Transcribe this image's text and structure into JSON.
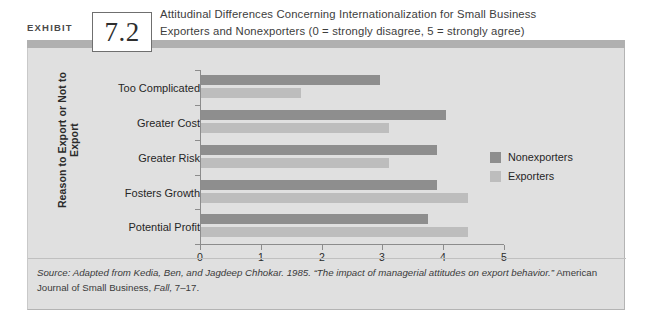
{
  "exhibit": {
    "label": "EXHIBIT",
    "number": "7.2"
  },
  "title": {
    "line1": "Attitudinal Differences Concerning Internationalization for Small Business",
    "line2": "Exporters and Nonexporters (0 = strongly disagree, 5 = strongly agree)"
  },
  "source": {
    "prefix": "Source:",
    "italic_main": " Adapted from Kedia, Ben, and Jagdeep Chhokar. 1985. “The impact of managerial attitudes on export behavior.”",
    "plain_after": " American Journal of Small Business, ",
    "italic_tail": "Fall,",
    "tail_rest": " 7–17."
  },
  "colors": {
    "nonexporters": "#8e8e8e",
    "exporters": "#bdbdbd",
    "panel_background": "#e0e0e0",
    "band": "#b0b0b0",
    "axis": "#8c8c8c"
  },
  "chart_data": {
    "type": "bar",
    "orientation": "horizontal",
    "title": "Attitudinal Differences Concerning Internationalization for Small Business Exporters and Nonexporters (0 = strongly disagree, 5 = strongly agree)",
    "xlabel": "",
    "ylabel": "Reason to Export or Not to Export",
    "xlim": [
      0,
      5
    ],
    "xticks": [
      0,
      1,
      2,
      3,
      4,
      5
    ],
    "xticklabels": [
      "0",
      "1",
      "2",
      "3",
      "4",
      "5"
    ],
    "grid": false,
    "legend_position": "right",
    "categories": [
      "Too Complicated",
      "Greater Cost",
      "Greater Risk",
      "Fosters Growth",
      "Potential Profit"
    ],
    "series": [
      {
        "name": "Nonexporters",
        "color": "#8e8e8e",
        "values": [
          2.95,
          4.05,
          3.9,
          3.9,
          3.75
        ]
      },
      {
        "name": "Exporters",
        "color": "#bdbdbd",
        "values": [
          1.65,
          3.1,
          3.1,
          4.4,
          4.4
        ]
      }
    ]
  }
}
